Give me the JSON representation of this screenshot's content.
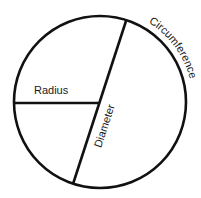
{
  "diagram": {
    "type": "circle-parts",
    "colors": {
      "background": "#ffffff",
      "stroke": "#111111",
      "text": "#1a1a1a"
    },
    "circle": {
      "cx": 100,
      "cy": 102,
      "r": 86,
      "stroke_width": 2.6
    },
    "radius_line": {
      "x1": 15,
      "y1": 103,
      "x2": 100,
      "y2": 103,
      "label": "Radius",
      "label_x": 34,
      "label_y": 94
    },
    "diameter_line": {
      "x1": 126,
      "y1": 21,
      "x2": 73,
      "y2": 184,
      "label": "Diameter",
      "label_x": 108,
      "label_y": 110,
      "label_rotation": -72
    },
    "circumference": {
      "label": "Circumference",
      "label_arc_r": 93
    }
  }
}
